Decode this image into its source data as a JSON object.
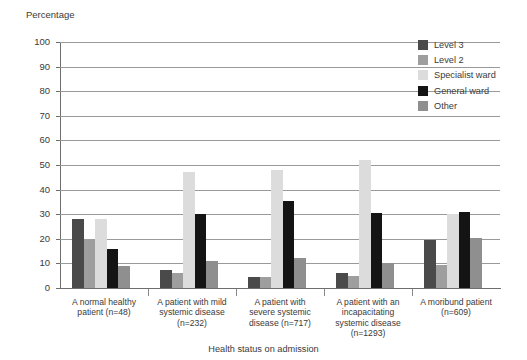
{
  "chart_data": {
    "type": "bar",
    "title": "",
    "ylabel": "Percentage",
    "xlabel": "Health status on admission",
    "ylim": [
      0,
      100
    ],
    "yticks": [
      0,
      10,
      20,
      30,
      40,
      50,
      60,
      70,
      80,
      90,
      100
    ],
    "grid": true,
    "legend_position": "top-right",
    "categories": [
      "A normal healthy patient (n=48)",
      "A patient with mild systemic disease (n=232)",
      "A patient with severe systemic disease (n=717)",
      "A patient with an incapacitating systemic disease (n=1293)",
      "A moribund patient (n=609)"
    ],
    "category_lines": [
      [
        "A normal healthy",
        "patient (n=48)"
      ],
      [
        "A patient with mild",
        "systemic disease",
        "(n=232)"
      ],
      [
        "A patient with",
        "severe systemic",
        "disease (n=717)"
      ],
      [
        "A patient with an",
        "incapacitating",
        "systemic disease",
        "(n=1293)"
      ],
      [
        "A moribund patient",
        "(n=609)"
      ]
    ],
    "series": [
      {
        "name": "Level 3",
        "color": "#4a4a4a",
        "values": [
          28,
          7.5,
          4.5,
          6.3,
          19.5
        ]
      },
      {
        "name": "Level 2",
        "color": "#9e9e9e",
        "values": [
          20,
          6,
          4.4,
          4.8,
          9.5
        ]
      },
      {
        "name": "Specialist ward",
        "color": "#dcdcdc",
        "values": [
          28,
          47,
          48,
          52,
          30
        ]
      },
      {
        "name": "General ward",
        "color": "#141414",
        "values": [
          16,
          30.2,
          35.3,
          30.5,
          31
        ]
      },
      {
        "name": "Other",
        "color": "#8f8f8f",
        "values": [
          9,
          11,
          12.2,
          10.3,
          20.5
        ]
      }
    ]
  },
  "legend": {
    "items": [
      {
        "label": "Level 3",
        "color": "#4a4a4a"
      },
      {
        "label": "Level 2",
        "color": "#9e9e9e"
      },
      {
        "label": "Specialist ward",
        "color": "#dcdcdc"
      },
      {
        "label": "General ward",
        "color": "#141414"
      },
      {
        "label": "Other",
        "color": "#8f8f8f"
      }
    ]
  }
}
